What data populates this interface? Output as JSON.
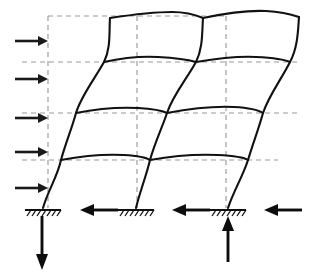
{
  "diagram": {
    "type": "structural-frame-deflection",
    "canvas": {
      "width": 314,
      "height": 278,
      "background": "#ffffff"
    },
    "colors": {
      "deformed_member": "#111111",
      "undeformed_grid": "#9a9a9a",
      "applied_load_arrow": "#1a1a1a",
      "reaction_arrow": "#0d0d0d",
      "support_symbol": "#111111"
    },
    "geometry": {
      "stories": 4,
      "bays": 2,
      "column_grid_x": [
        48,
        137,
        226
      ],
      "floor_grid_y": [
        16,
        62,
        113,
        160
      ],
      "base_y": 208
    },
    "undeformed_grid": {
      "style": "dashed",
      "label": "undeformed frame outline",
      "vertical_lines": [
        {
          "name": "grid-line-A",
          "x": 48,
          "y1": 16,
          "y2": 208
        },
        {
          "name": "grid-line-B",
          "x": 137,
          "y1": 16,
          "y2": 208
        },
        {
          "name": "grid-line-C",
          "x": 226,
          "y1": 16,
          "y2": 208
        }
      ],
      "horizontal_lines": [
        {
          "name": "grid-level-roof",
          "y": 16,
          "x1": 48,
          "x2": 226
        },
        {
          "name": "grid-level-3",
          "y": 62,
          "x1": 20,
          "x2": 300
        },
        {
          "name": "grid-level-2",
          "y": 113,
          "x1": 20,
          "x2": 300
        },
        {
          "name": "grid-level-1",
          "y": 160,
          "x1": 20,
          "x2": 280
        }
      ]
    },
    "deformed_shape": {
      "style": "solid-curve",
      "label": "deflected shape under lateral load",
      "columns": [
        {
          "name": "column-left",
          "path": "M 43 208 C 48 190 57 178 61 160 C 66 142 72 128 76 113 C 81 96 94 80 104 62 C 111 48 109 32 110 18"
        },
        {
          "name": "column-middle",
          "path": "M 136 208 C 140 191 146 177 150 160 C 155 142 162 128 167 113 C 173 95 186 80 196 62 C 203 48 202 32 203 18"
        },
        {
          "name": "column-right",
          "path": "M 228 208 C 234 190 243 176 248 160 C 253 143 259 128 263 113 C 269 95 281 80 290 62 C 298 47 298 30 299 17"
        }
      ],
      "beams": [
        {
          "name": "beam-roof-left",
          "path": "M 110 18 C 130 15 152 12 172 12 C 187 12 196 15 203 18"
        },
        {
          "name": "beam-roof-right",
          "path": "M 203 18 C 222 14 246 10 266 11 C 283 12 293 15 299 17"
        },
        {
          "name": "beam-level3-left",
          "path": "M 104 62 C 122 58 140 56 158 57 C 176 58 189 60 196 62"
        },
        {
          "name": "beam-level3-right",
          "path": "M 196 62 C 214 59 236 56 256 57 C 276 58 286 60 290 62"
        },
        {
          "name": "beam-level2-left",
          "path": "M 76 113 C 96 109 118 107 138 108 C 156 109 163 111 167 113"
        },
        {
          "name": "beam-level2-right",
          "path": "M 167 113 C 188 109 212 106 234 107 C 252 108 260 111 263 113"
        },
        {
          "name": "beam-level1-left",
          "path": "M 61 160 C 82 156 104 154 124 155 C 141 156 147 158 150 160"
        },
        {
          "name": "beam-level1-right",
          "path": "M 150 160 C 172 156 196 154 218 155 C 238 156 245 158 248 160"
        }
      ]
    },
    "supports": [
      {
        "name": "support-fixed-left",
        "type": "fixed-base",
        "x": 43,
        "y": 208,
        "width": 36
      },
      {
        "name": "support-fixed-middle",
        "type": "fixed-base",
        "x": 136,
        "y": 208,
        "width": 36
      },
      {
        "name": "support-fixed-right",
        "type": "fixed-base",
        "x": 228,
        "y": 208,
        "width": 36
      }
    ],
    "applied_loads": {
      "label": "lateral story forces",
      "direction": "right",
      "arrows": [
        {
          "name": "lateral-load-story-4",
          "y": 41,
          "x_tail": 15,
          "x_head": 48
        },
        {
          "name": "lateral-load-story-3",
          "y": 79,
          "x_tail": 15,
          "x_head": 48
        },
        {
          "name": "lateral-load-story-2",
          "y": 118,
          "x_tail": 15,
          "x_head": 48
        },
        {
          "name": "lateral-load-story-1",
          "y": 152,
          "x_tail": 15,
          "x_head": 48
        },
        {
          "name": "lateral-load-base",
          "y": 188,
          "x_tail": 15,
          "x_head": 48
        }
      ]
    },
    "reactions": {
      "label": "base support reactions",
      "horizontal": [
        {
          "name": "reaction-horizontal-left",
          "y": 210,
          "x_tail": 118,
          "x_head": 82,
          "direction": "left"
        },
        {
          "name": "reaction-horizontal-middle",
          "y": 210,
          "x_tail": 210,
          "x_head": 174,
          "direction": "left"
        },
        {
          "name": "reaction-horizontal-right",
          "y": 210,
          "x_tail": 302,
          "x_head": 266,
          "direction": "left"
        }
      ],
      "vertical": [
        {
          "name": "reaction-vertical-left-down",
          "x": 42,
          "y_tail": 215,
          "y_head": 268,
          "direction": "down"
        },
        {
          "name": "reaction-vertical-right-up",
          "x": 228,
          "y_tail": 262,
          "y_head": 217,
          "direction": "up"
        }
      ]
    }
  }
}
